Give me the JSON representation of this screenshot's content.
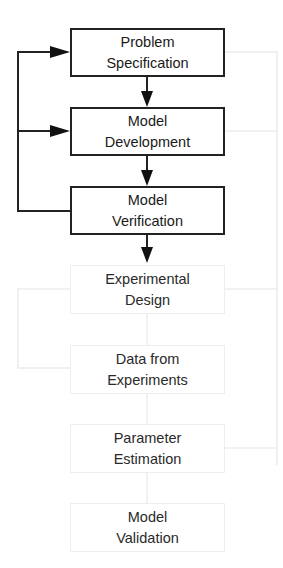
{
  "diagram": {
    "type": "flowchart",
    "boxes": [
      {
        "id": "problem-specification",
        "line1": "Problem",
        "line2": "Specification",
        "faded": false
      },
      {
        "id": "model-development",
        "line1": "Model",
        "line2": "Development",
        "faded": false
      },
      {
        "id": "model-verification",
        "line1": "Model",
        "line2": "Verification",
        "faded": false
      },
      {
        "id": "experimental-design",
        "line1": "Experimental",
        "line2": "Design",
        "faded": true
      },
      {
        "id": "data-from-experiments",
        "line1": "Data from",
        "line2": "Experiments",
        "faded": true
      },
      {
        "id": "parameter-estimation",
        "line1": "Parameter",
        "line2": "Estimation",
        "faded": true
      },
      {
        "id": "model-validation",
        "line1": "Model",
        "line2": "Validation",
        "faded": true
      }
    ],
    "edges": [
      {
        "from": "problem-specification",
        "to": "model-development"
      },
      {
        "from": "model-development",
        "to": "model-verification"
      },
      {
        "from": "model-verification",
        "to": "experimental-design"
      },
      {
        "from": "model-verification",
        "to": "problem-specification",
        "kind": "feedback-left"
      },
      {
        "from": "model-verification",
        "to": "model-development",
        "kind": "feedback-left"
      }
    ],
    "colors": {
      "line": "#222222",
      "faded_line": "#ececec",
      "text": "#1a1a1a"
    }
  }
}
